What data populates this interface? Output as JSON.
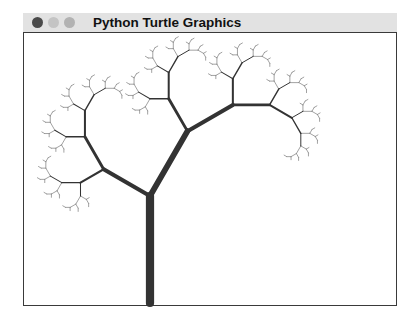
{
  "window": {
    "title": "Python Turtle Graphics",
    "buttons": [
      {
        "name": "close",
        "color": "#4a4a4a"
      },
      {
        "name": "minimize",
        "color": "#c4c4c4"
      },
      {
        "name": "maximize",
        "color": "#b2b2b2"
      }
    ]
  },
  "canvas": {
    "background": "#ffffff",
    "drawing": {
      "type": "recursive-fractal-tree",
      "start": [
        149,
        302
      ],
      "heading_deg": 90,
      "trunk_length": 107,
      "right_branch": {
        "turn_deg": -30,
        "scale": 0.7
      },
      "left_branch": {
        "turn_deg": 60,
        "scale": 0.5
      },
      "min_length": 2.5,
      "width_divisor": 13,
      "stroke_color": "#333333",
      "thin_stroke_color": "#8a8a8a"
    }
  }
}
